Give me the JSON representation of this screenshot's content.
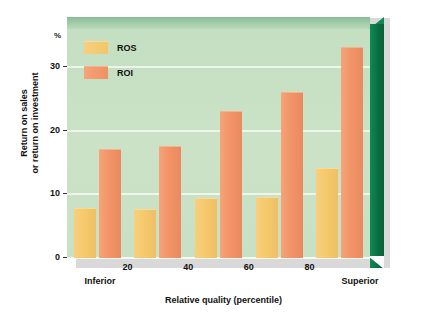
{
  "chart_data": {
    "type": "bar",
    "title": "",
    "xlabel": "Relative quality (percentile)",
    "ylabel": "Return on sales or return on investment",
    "yunit": "%",
    "categories": [
      "10",
      "30",
      "50",
      "70",
      "90"
    ],
    "series": [
      {
        "name": "ROS",
        "color": "#F3C66A",
        "values": [
          7.7,
          7.6,
          9.2,
          9.4,
          14.0
        ]
      },
      {
        "name": "ROI",
        "color": "#F09066",
        "values": [
          17.0,
          17.4,
          23.0,
          26.0,
          33.0
        ]
      }
    ],
    "ylim": [
      0,
      36
    ],
    "yticks": [
      "0",
      "10",
      "20",
      "30"
    ],
    "ytick_values": [
      0,
      10,
      20,
      30
    ],
    "xticks": [
      "20",
      "40",
      "60",
      "80"
    ],
    "xtick_values": [
      20,
      40,
      60,
      80
    ],
    "x_endpoint_low": "Inferior",
    "x_endpoint_high": "Superior",
    "grid": true,
    "legend_position": "top-left",
    "plot_background": "#C8E0C4",
    "frame_accent": "#0C7A4A"
  },
  "axes": {
    "unit_label": "%",
    "y_title_line1": "Return on sales",
    "y_title_line2": "or return on investment",
    "x_title": "Relative quality (percentile)",
    "y_ticks": [
      {
        "label": "30",
        "value": 30
      },
      {
        "label": "20",
        "value": 20
      },
      {
        "label": "10",
        "value": 10
      },
      {
        "label": "0",
        "value": 0
      }
    ],
    "x_ticks": [
      {
        "label": "20",
        "value": 20
      },
      {
        "label": "40",
        "value": 40
      },
      {
        "label": "60",
        "value": 60
      },
      {
        "label": "80",
        "value": 80
      }
    ],
    "x_low_label": "Inferior",
    "x_high_label": "Superior"
  },
  "legend": {
    "items": [
      {
        "label": "ROS",
        "color": "#F3C66A"
      },
      {
        "label": "ROI",
        "color": "#F09066"
      }
    ]
  }
}
